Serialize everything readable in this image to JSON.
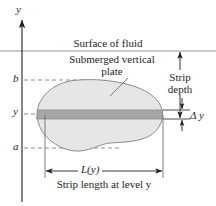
{
  "figure": {
    "title_text_surface": "Surface of fluid",
    "axis_label_y": "y",
    "plate_label_line1": "Submerged vertical",
    "plate_label_line2": "plate",
    "strip_depth_line1": "Strip",
    "strip_depth_line2": "depth",
    "delta_y_label": "Δ y",
    "length_label": "L(y)",
    "caption": "Strip length at level y",
    "tick_labels": {
      "upper": "b",
      "middle": "y",
      "lower": "a"
    },
    "colors": {
      "plate_fill": "#e6e6e6",
      "plate_outline": "#8c8c8c",
      "strip_fill": "#a6a6a6",
      "strip_outline": "#8c8c8c",
      "line": "#231f20",
      "surface_line": "#9a9a9a",
      "dashed_line": "#7f7f7f",
      "background": "#ffffff"
    },
    "geometry": {
      "y_axis_x": 22,
      "surface_y": 51,
      "level_b_y": 80,
      "level_y_y": 114,
      "level_a_y": 148,
      "strip_top_y": 110,
      "strip_bottom_y": 119,
      "strip_left_x": 41,
      "strip_right_x": 161,
      "depth_arrow_x": 180,
      "length_arrow_y": 171
    }
  }
}
